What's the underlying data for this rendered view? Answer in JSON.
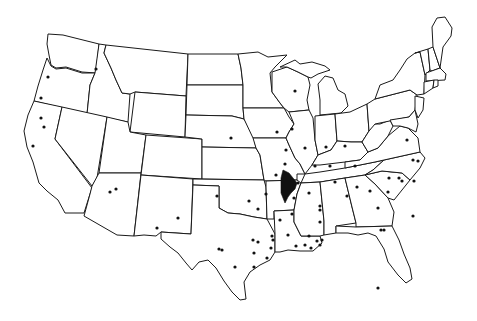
{
  "map": {
    "title": "",
    "colors": {
      "stroke": "#1a1a1a",
      "fill": "#ffffff",
      "dot": "#111111",
      "highlight": "#111111"
    },
    "highlight_region": {
      "label": "",
      "points": "283,170 289,173 293,178 297,183 295,189 291,193 288,197 285,203 283,198 281,193 281,185 281,178"
    },
    "dots": [
      [
        96,
        69
      ],
      [
        48,
        77
      ],
      [
        41,
        98
      ],
      [
        41,
        118
      ],
      [
        44,
        127
      ],
      [
        33,
        146
      ],
      [
        110,
        192
      ],
      [
        116,
        189
      ],
      [
        157,
        228
      ],
      [
        178,
        218
      ],
      [
        217,
        196
      ],
      [
        231,
        138
      ],
      [
        277,
        132
      ],
      [
        286,
        150
      ],
      [
        276,
        175
      ],
      [
        258,
        209
      ],
      [
        280,
        220
      ],
      [
        285,
        164
      ],
      [
        298,
        183
      ],
      [
        294,
        198
      ],
      [
        292,
        214
      ],
      [
        272,
        236
      ],
      [
        296,
        246
      ],
      [
        305,
        245
      ],
      [
        309,
        236
      ],
      [
        320,
        245
      ],
      [
        309,
        193
      ],
      [
        320,
        210
      ],
      [
        320,
        222
      ],
      [
        322,
        240
      ],
      [
        320,
        206
      ],
      [
        347,
        196
      ],
      [
        357,
        187
      ],
      [
        355,
        166
      ],
      [
        370,
        191
      ],
      [
        378,
        208
      ],
      [
        384,
        230
      ],
      [
        389,
        178
      ],
      [
        399,
        178
      ],
      [
        402,
        181
      ],
      [
        414,
        181
      ],
      [
        388,
        192
      ],
      [
        381,
        230
      ],
      [
        330,
        166
      ],
      [
        345,
        146
      ],
      [
        326,
        147
      ],
      [
        305,
        148
      ],
      [
        292,
        129
      ],
      [
        295,
        91
      ],
      [
        315,
        166
      ],
      [
        335,
        182
      ],
      [
        258,
        242
      ],
      [
        253,
        240
      ],
      [
        235,
        267
      ],
      [
        254,
        267
      ],
      [
        273,
        240
      ],
      [
        219,
        249
      ],
      [
        254,
        253
      ],
      [
        267,
        258
      ],
      [
        271,
        248
      ],
      [
        311,
        248
      ],
      [
        317,
        241
      ],
      [
        413,
        216
      ],
      [
        378,
        288
      ],
      [
        407,
        140
      ],
      [
        418,
        161
      ],
      [
        413,
        160
      ],
      [
        288,
        235
      ],
      [
        266,
        194
      ],
      [
        249,
        201
      ],
      [
        222,
        250
      ]
    ]
  }
}
